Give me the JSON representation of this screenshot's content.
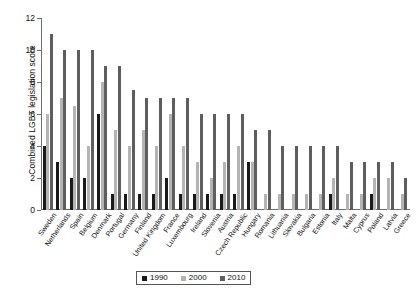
{
  "chart_data": {
    "type": "bar",
    "title": "",
    "xlabel": "",
    "ylabel": "Combined LGBT legislation score",
    "ylim": [
      0,
      12
    ],
    "yticks": [
      0,
      2,
      4,
      6,
      8,
      10,
      12
    ],
    "ytick_labels": [
      "0",
      "2",
      "4",
      "6",
      "8",
      "10",
      "12"
    ],
    "grid": false,
    "legend_position": "bottom-center",
    "categories": [
      "Sweden",
      "Netherlands",
      "Spain",
      "Belgium",
      "Denmark",
      "Portugal",
      "Germany",
      "Finland",
      "United Kingdom",
      "France",
      "Luxembourg",
      "Ireland",
      "Slovenia",
      "Austria",
      "Czech Republic",
      "Hungary",
      "Romania",
      "Lithuania",
      "Slovakia",
      "Bulgaria",
      "Estonia",
      "Italy",
      "Malta",
      "Cyprus",
      "Poland",
      "Latvia",
      "Greece"
    ],
    "series": [
      {
        "name": "1990",
        "color": "#1a1a1a",
        "values": [
          4,
          3,
          2,
          2,
          6,
          1,
          1,
          1,
          1,
          2,
          1,
          1,
          1,
          1,
          1,
          3,
          0,
          0,
          0,
          0,
          0,
          1,
          0,
          0,
          1,
          0,
          0
        ]
      },
      {
        "name": "2000",
        "color": "#b4b4b4",
        "values": [
          6,
          7,
          6.5,
          4,
          8,
          5,
          4,
          5,
          4,
          6,
          4,
          3,
          2,
          3,
          4,
          3,
          1,
          1,
          1,
          1,
          1,
          2,
          1,
          1,
          2,
          2,
          1
        ]
      },
      {
        "name": "2010",
        "color": "#5e5e5e",
        "values": [
          11,
          10,
          10,
          10,
          9,
          9,
          7.5,
          7,
          7,
          7,
          7,
          6,
          6,
          6,
          6,
          5,
          5,
          4,
          4,
          4,
          4,
          4,
          3,
          3,
          3,
          3,
          2
        ]
      }
    ]
  },
  "legend": {
    "items": [
      {
        "label": "1990",
        "color": "#1a1a1a"
      },
      {
        "label": "2000",
        "color": "#b4b4b4"
      },
      {
        "label": "2010",
        "color": "#5e5e5e"
      }
    ]
  }
}
